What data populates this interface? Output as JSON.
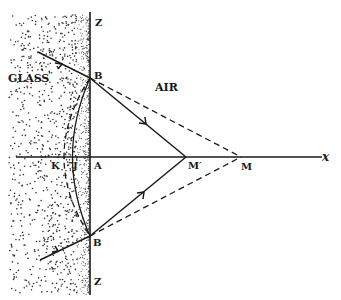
{
  "diagram": {
    "regions": {
      "glass": "GLASS",
      "air": "AIR"
    },
    "points": {
      "z_top": "Z",
      "z_bottom": "Z",
      "b_top": "B",
      "b_bottom": "B",
      "k": "K",
      "j": "J",
      "a": "A",
      "m_prime": "M′",
      "m": "M",
      "x_axis": "x"
    },
    "colors": {
      "ink": "#1a1a1a",
      "background": "#ffffff"
    }
  }
}
